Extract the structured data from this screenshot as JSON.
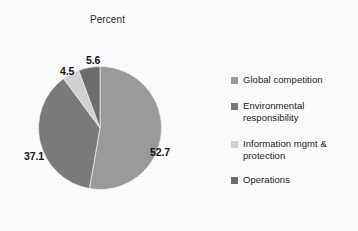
{
  "chart_data": {
    "type": "pie",
    "title": "Percent",
    "xlabel": "",
    "ylabel": "",
    "legend_position": "right",
    "grid": false,
    "categories": [
      "Global competition",
      "Environmental responsibility",
      "Information mgmt & protection",
      "Operations"
    ],
    "values": [
      52.7,
      37.1,
      4.5,
      5.6
    ],
    "data_labels": [
      "52.7",
      "37.1",
      "4.5",
      "5.6"
    ],
    "colors": [
      "#9b9b9b",
      "#7b7b7b",
      "#d2d2d2",
      "#6d6d6d"
    ]
  },
  "title": {
    "text": "Percent"
  },
  "pie": {
    "slices": [
      {
        "label": "52.7",
        "name": "Global competition",
        "value": 52.7,
        "color": "#9b9b9b"
      },
      {
        "label": "37.1",
        "name": "Environmental responsibility",
        "value": 37.1,
        "color": "#7b7b7b"
      },
      {
        "label": "4.5",
        "name": "Information mgmt & protection",
        "value": 4.5,
        "color": "#d2d2d2"
      },
      {
        "label": "5.6",
        "name": "Operations",
        "value": 5.6,
        "color": "#6d6d6d"
      }
    ]
  },
  "legend": {
    "items": [
      {
        "label": "Global competition",
        "color": "#9b9b9b"
      },
      {
        "label": "Environmental responsibility",
        "color": "#7b7b7b"
      },
      {
        "label": "Information mgmt & protection",
        "color": "#d2d2d2"
      },
      {
        "label": "Operations",
        "color": "#6d6d6d"
      }
    ]
  }
}
